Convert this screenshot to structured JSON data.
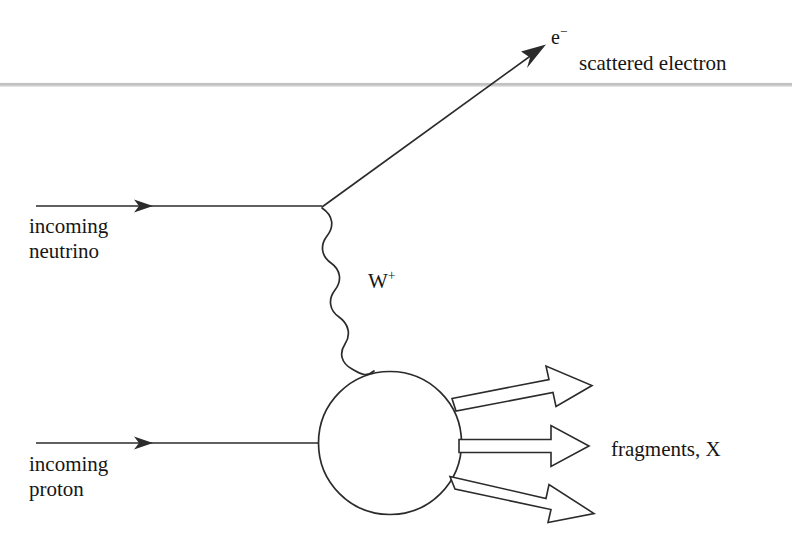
{
  "diagram": {
    "background_color": "#ffffff",
    "stroke_color": "#2b2b2b",
    "rule_color": "#bcbcbc",
    "labels": {
      "scattered_electron_particle": "e",
      "scattered_electron_charge": "−",
      "scattered_electron_caption": "scattered electron",
      "incoming_neutrino_line1": "incoming",
      "incoming_neutrino_line2": "neutrino",
      "w_boson_symbol": "W",
      "w_boson_charge": "+",
      "incoming_proton_line1": "incoming",
      "incoming_proton_line2": "proton",
      "fragments_caption": "fragments, X"
    },
    "elements": {
      "horizontal_rule": {
        "y": 85,
        "x_start": 0,
        "x_end": 792
      },
      "neutrino_line": {
        "x_start": 36,
        "x_end": 322,
        "y": 206,
        "arrow_at_x": 150
      },
      "vertex": {
        "x": 322,
        "y": 207
      },
      "electron_line": {
        "x_start": 322,
        "y_start": 207,
        "x_end": 545,
        "y_end": 45
      },
      "w_propagator": {
        "x_start": 322,
        "y_start": 209,
        "x_end": 376,
        "y_end": 370,
        "waves": 7
      },
      "blob_circle": {
        "cx": 390,
        "cy": 443,
        "r": 72
      },
      "proton_line": {
        "x_start": 36,
        "x_end": 318,
        "y": 443,
        "arrow_at_x": 150
      },
      "fragment_arrows": [
        {
          "name": "upper",
          "x_start": 455,
          "y_start": 404,
          "x_end": 592,
          "y_end": 377,
          "width": 13
        },
        {
          "name": "middle",
          "x_start": 460,
          "y_start": 446,
          "x_end": 589,
          "y_end": 446,
          "width": 13
        },
        {
          "name": "lower",
          "x_start": 452,
          "y_start": 482,
          "x_end": 594,
          "y_end": 515,
          "width": 13
        }
      ]
    }
  }
}
